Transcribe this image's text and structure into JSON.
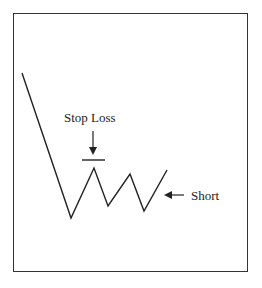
{
  "diagram": {
    "type": "price-pattern",
    "labels": {
      "stop_loss": "Stop Loss",
      "short": "Short"
    },
    "price_path": [
      [
        22,
        73
      ],
      [
        71,
        218
      ],
      [
        94,
        168
      ],
      [
        108,
        206
      ],
      [
        130,
        174
      ],
      [
        144,
        211
      ],
      [
        167,
        170
      ]
    ],
    "stop_loss_bar": {
      "x1": 82,
      "x2": 105,
      "y": 160
    },
    "colors": {
      "line": "#222222",
      "frame": "#333333",
      "background": "#ffffff"
    }
  }
}
